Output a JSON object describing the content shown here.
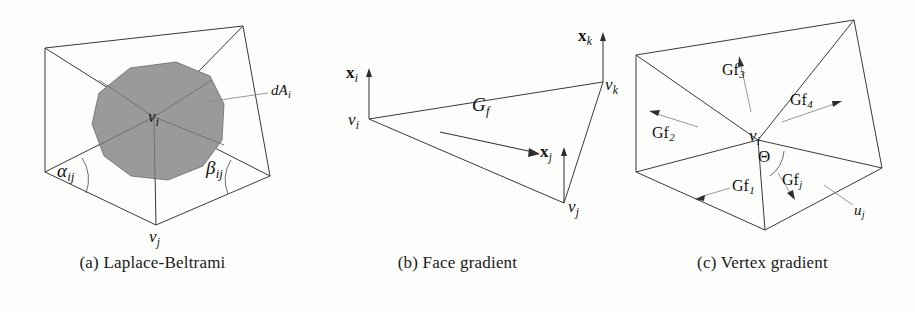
{
  "figure": {
    "background_color": "#fdfdfc",
    "ink_color": "#3a3a3a",
    "region_fill_color": "#999a99"
  },
  "panels": [
    {
      "id": "laplace-beltrami",
      "caption": "(a) Laplace-Beltrami",
      "labels": {
        "center_vertex": "v",
        "center_vertex_sub": "i",
        "bottom_vertex": "v",
        "bottom_vertex_sub": "j",
        "alpha": "α",
        "alpha_sub": "ij",
        "beta": "β",
        "beta_sub": "ij",
        "area": "dA",
        "area_sub": "i"
      }
    },
    {
      "id": "face-gradient",
      "caption": "(b) Face gradient",
      "labels": {
        "xi": "x",
        "xi_sub": "i",
        "xj": "x",
        "xj_sub": "j",
        "xk": "x",
        "xk_sub": "k",
        "vi": "v",
        "vi_sub": "i",
        "vj": "v",
        "vj_sub": "j",
        "vk": "v",
        "vk_sub": "k",
        "gradient": "G",
        "gradient_sub": "f"
      }
    },
    {
      "id": "vertex-gradient",
      "caption": "(c) Vertex gradient",
      "labels": {
        "gf1": "Gf",
        "gf1_sub": "1",
        "gf2": "Gf",
        "gf2_sub": "2",
        "gf3": "Gf",
        "gf3_sub": "3",
        "gf4": "Gf",
        "gf4_sub": "4",
        "gfj": "Gf",
        "gfj_sub": "j",
        "theta": "Θ",
        "vi": "v",
        "vi_sub": "i",
        "uj": "u",
        "uj_sub": "j"
      }
    }
  ]
}
